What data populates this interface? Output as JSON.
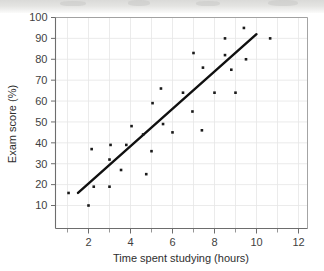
{
  "chart_data": {
    "type": "scatter",
    "title": "",
    "xlabel": "Time spent studying (hours)",
    "ylabel": "Exam score (%)",
    "xlim": [
      0,
      12
    ],
    "ylim": [
      0,
      100
    ],
    "xticks": [
      2,
      4,
      6,
      8,
      10,
      12
    ],
    "xtick_labels": [
      "2",
      "4",
      "6",
      "8",
      "10",
      "12"
    ],
    "xminor_ticks": [
      1,
      3,
      5,
      7,
      9,
      11
    ],
    "yticks": [
      10,
      20,
      30,
      40,
      50,
      60,
      70,
      80,
      90,
      100
    ],
    "ytick_labels": [
      "10",
      "20",
      "30",
      "40",
      "50",
      "60",
      "70",
      "80",
      "90",
      "100"
    ],
    "grid": true,
    "grid_axis": "both",
    "legend": false,
    "legend_position": "none",
    "marker": "square",
    "marker_color": "#1a1a1a",
    "marker_size": 2.6,
    "points": [
      {
        "x": 1.05,
        "y": 16
      },
      {
        "x": 2.0,
        "y": 10
      },
      {
        "x": 2.15,
        "y": 37
      },
      {
        "x": 2.25,
        "y": 19
      },
      {
        "x": 3.0,
        "y": 19
      },
      {
        "x": 3.0,
        "y": 32
      },
      {
        "x": 3.05,
        "y": 39
      },
      {
        "x": 3.55,
        "y": 27
      },
      {
        "x": 3.8,
        "y": 39
      },
      {
        "x": 4.05,
        "y": 48
      },
      {
        "x": 4.6,
        "y": 44
      },
      {
        "x": 4.75,
        "y": 25
      },
      {
        "x": 5.0,
        "y": 36
      },
      {
        "x": 5.05,
        "y": 59
      },
      {
        "x": 5.45,
        "y": 66
      },
      {
        "x": 5.55,
        "y": 49
      },
      {
        "x": 6.0,
        "y": 45
      },
      {
        "x": 6.5,
        "y": 64
      },
      {
        "x": 6.95,
        "y": 55
      },
      {
        "x": 7.0,
        "y": 83
      },
      {
        "x": 7.4,
        "y": 46
      },
      {
        "x": 7.45,
        "y": 76
      },
      {
        "x": 8.0,
        "y": 64
      },
      {
        "x": 8.5,
        "y": 82
      },
      {
        "x": 8.5,
        "y": 90
      },
      {
        "x": 8.8,
        "y": 75
      },
      {
        "x": 9.0,
        "y": 64
      },
      {
        "x": 9.4,
        "y": 95
      },
      {
        "x": 9.5,
        "y": 80
      },
      {
        "x": 10.65,
        "y": 90
      }
    ],
    "trend_line": {
      "label": "line of best fit",
      "x_start": 1.5,
      "y_start": 16,
      "x_end": 10.0,
      "y_end": 92,
      "color": "#101010"
    }
  }
}
